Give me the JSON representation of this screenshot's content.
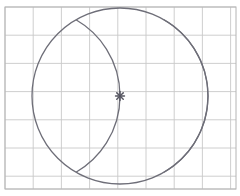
{
  "canvas": {
    "width": 240,
    "height": 196,
    "background_color": "#ffffff",
    "title": "Geometric construction: circle with two intersecting arcs on graph paper"
  },
  "grid": {
    "name": "graph-paper-grid",
    "line_color": "#c8c8c8",
    "border_color": "#b4b4b4",
    "line_width": 0.9,
    "border_width": 1.0,
    "origin_x": 5,
    "origin_y": 7,
    "cell_size": 28.2,
    "columns": 8,
    "rows": 6,
    "right_edge": 236,
    "bottom_edge": 189,
    "x_lines": [
      5,
      33.2,
      61.4,
      89.6,
      117.8,
      146.0,
      174.2,
      202.4,
      230.6
    ],
    "y_lines": [
      7,
      35.2,
      63.4,
      91.6,
      119.8,
      148.0,
      176.2,
      189
    ]
  },
  "figure": {
    "stroke_color": "#6e6e78",
    "stroke_width": 1.3,
    "fill": "none",
    "main_circle": {
      "name": "main-circle",
      "center_x": 120,
      "center_y": 96,
      "radius": 88,
      "left_point_x": 32,
      "right_point_x": 208,
      "top_point_y": 8,
      "bottom_point_y": 184
    },
    "left_arc": {
      "name": "left-construction-arc",
      "center_x": 32,
      "center_y": 96,
      "radius": 88,
      "description": "Arc centered at main circle left extreme, passing through the main circle center"
    },
    "right_arc": {
      "name": "right-construction-arc",
      "center_x": 208,
      "center_y": 96,
      "radius": 88,
      "description": "Arc centered at main circle right extreme, passing through the main circle center"
    }
  },
  "marker": {
    "name": "center-intersection-marker",
    "x": 120,
    "y": 96,
    "color": "#555560",
    "size": 9,
    "shape": "asterisk-cross",
    "label": ""
  }
}
